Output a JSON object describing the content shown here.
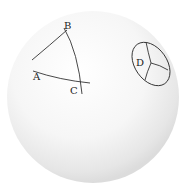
{
  "diagram": {
    "labels": {
      "A": "A",
      "B": "B",
      "C": "C",
      "D": "D"
    },
    "colors": {
      "background": "#ffffff",
      "sphere_light": "#ffffff",
      "sphere_shade": "#d8d8d8",
      "stroke": "#333333"
    }
  }
}
